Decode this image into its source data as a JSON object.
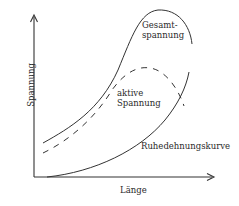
{
  "diagram": {
    "axes": {
      "x_label": "Länge",
      "y_label": "Spannung"
    },
    "curves": [
      {
        "id": "gesamt",
        "label_line1": "Gesamt-",
        "label_line2": "spannung",
        "style": "solid"
      },
      {
        "id": "aktiv",
        "label_line1": "aktive",
        "label_line2": "Spannung",
        "style": "dashed"
      },
      {
        "id": "ruhe",
        "label": "Ruhedehnungskurve",
        "style": "solid"
      }
    ],
    "stroke_color": "#333333"
  }
}
